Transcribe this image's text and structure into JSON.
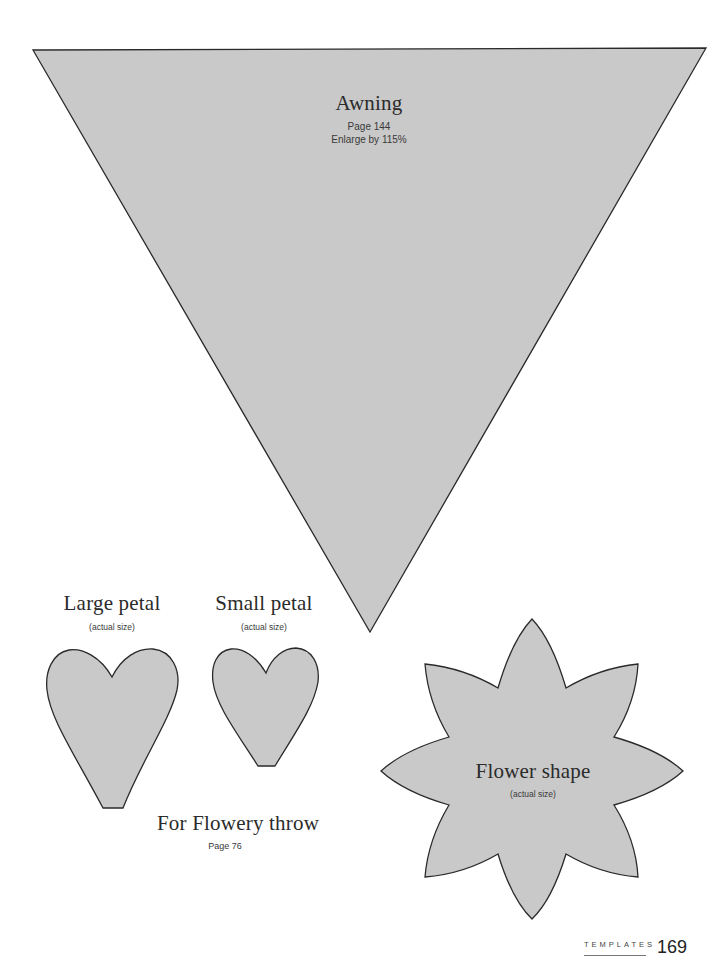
{
  "colors": {
    "shape_fill": "#c9c9c9",
    "shape_stroke": "#2a2a2a",
    "background": "#ffffff"
  },
  "awning": {
    "title": "Awning",
    "page_ref": "Page 144",
    "note": "Enlarge by 115%"
  },
  "large_petal": {
    "title": "Large petal",
    "note": "(actual size)"
  },
  "small_petal": {
    "title": "Small petal",
    "note": "(actual size)"
  },
  "petals_caption": {
    "title": "For Flowery throw",
    "page_ref": "Page 76"
  },
  "flower": {
    "title": "Flower shape",
    "note": "(actual size)"
  },
  "footer": {
    "section": "TEMPLATES",
    "page_number": "169"
  }
}
